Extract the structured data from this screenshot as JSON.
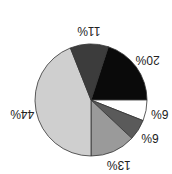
{
  "chart_data": {
    "type": "pie",
    "title": "",
    "orientation": "rotated 180 degrees",
    "categories": [
      "Slice A",
      "Slice B",
      "Slice C",
      "Slice D",
      "Slice E",
      "Slice F"
    ],
    "values": [
      20,
      6,
      6,
      13,
      44,
      11
    ],
    "labels": [
      "20%",
      "6%",
      "6%",
      "13%",
      "44%",
      "11%"
    ],
    "colors": [
      "#0a0a0a",
      "#ffffff",
      "#5a5a5a",
      "#9a9a9a",
      "#cfcfcf",
      "#3c3c3c"
    ],
    "legend": "none"
  }
}
